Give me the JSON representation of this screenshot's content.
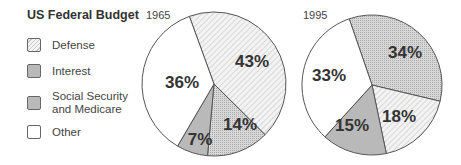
{
  "chart_data": [
    {
      "type": "pie",
      "title": "US Federal Budget",
      "subtitle": "1965",
      "categories": [
        "Defense",
        "Social Security and Medicare",
        "Interest",
        "Other"
      ],
      "values": [
        43,
        14,
        7,
        36
      ],
      "labels": [
        "43%",
        "14%",
        "7%",
        "36%"
      ]
    },
    {
      "type": "pie",
      "title": "US Federal Budget",
      "subtitle": "1995",
      "categories": [
        "Social Security and Medicare",
        "Defense",
        "Interest",
        "Other"
      ],
      "values": [
        34,
        18,
        15,
        33
      ],
      "labels": [
        "34%",
        "18%",
        "15%",
        "33%"
      ]
    }
  ],
  "title": "US Federal Budget",
  "legend": [
    {
      "label": "Defense",
      "pattern": "diagonal-hatch"
    },
    {
      "label": "Interest",
      "pattern": "solid-gray"
    },
    {
      "label": "Social Security and Medicare",
      "line1": "Social Security",
      "line2": "and Medicare",
      "pattern": "dotted"
    },
    {
      "label": "Other",
      "pattern": "white"
    }
  ],
  "years": [
    "1965",
    "1995"
  ],
  "colors": {
    "interest": "#b9b9b9",
    "ss": "#d2d2d2",
    "defense_bg": "#f2f2f2",
    "other": "#ffffff",
    "stroke": "#555555"
  }
}
